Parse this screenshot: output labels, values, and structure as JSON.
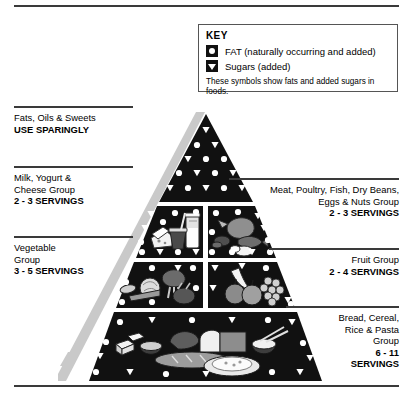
{
  "key": {
    "title": "KEY",
    "items": [
      {
        "symbol": "fat-circle-icon",
        "label": "FAT (naturally occurring and added)"
      },
      {
        "symbol": "sugar-triangle-icon",
        "label": "Sugars (added)"
      }
    ],
    "note": "These symbols show fats and added sugars in foods."
  },
  "groups": [
    {
      "id": "fats-oils-sweets",
      "name": "Fats, Oils & Sweets",
      "servings": "USE SPARINGLY",
      "side": "left"
    },
    {
      "id": "milk-yogurt-cheese",
      "name_line1": "Milk, Yogurt &",
      "name_line2": "Cheese Group",
      "servings": "2 - 3 SERVINGS",
      "side": "left"
    },
    {
      "id": "vegetable",
      "name_line1": "Vegetable",
      "name_line2": "Group",
      "servings": "3 - 5 SERVINGS",
      "side": "left"
    },
    {
      "id": "meat-poultry-fish",
      "name_line1": "Meat, Poultry, Fish, Dry Beans,",
      "name_line2": "Eggs & Nuts Group",
      "servings": "2 - 3 SERVINGS",
      "side": "right"
    },
    {
      "id": "fruit",
      "name_line1": "Fruit Group",
      "servings": "2 - 4 SERVINGS",
      "side": "right"
    },
    {
      "id": "bread-cereal-rice-pasta",
      "name_line1": "Bread, Cereal,",
      "name_line2": "Rice & Pasta",
      "name_line3": "Group",
      "servings_line1": "6 - 11",
      "servings_line2": "SERVINGS",
      "side": "right"
    }
  ],
  "colors": {
    "pyramid_fill": "#111111",
    "symbol_fill": "#ffffff",
    "rule": "#3a3a3a",
    "shadow": "#c9c9c9",
    "background": "#ffffff"
  }
}
